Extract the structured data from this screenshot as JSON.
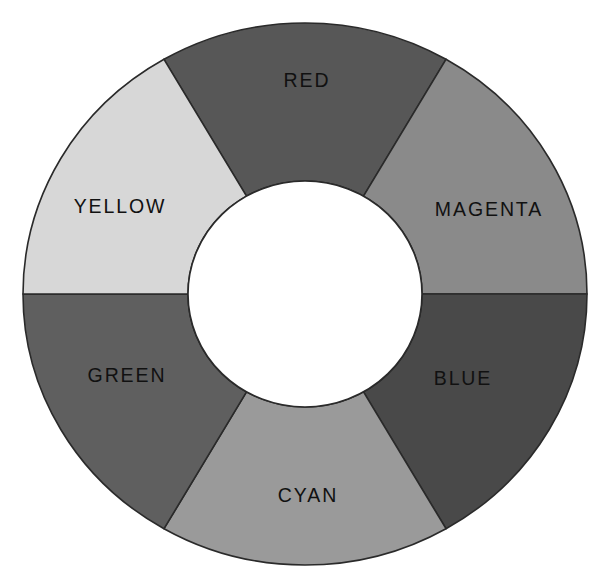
{
  "figure": {
    "name": "color-wheel",
    "background_color": "#ffffff",
    "outline_color": "#2a2a2a",
    "label_color": "#111111",
    "hub_color": "#ffffff",
    "center_x": 305,
    "center_y": 294,
    "outer_radius_x": 282,
    "outer_radius_y": 271,
    "inner_radius_x": 117,
    "inner_radius_y": 113
  },
  "chart_data": {
    "type": "pie",
    "subtype": "donut",
    "grid": false,
    "legend": "none",
    "labels_inside_slices": true,
    "slice_count": 6,
    "slice_angle_degrees": 60,
    "categories": [
      "RED",
      "MAGENTA",
      "BLUE",
      "CYAN",
      "GREEN",
      "YELLOW"
    ],
    "values": [
      60,
      60,
      60,
      60,
      60,
      60
    ],
    "colors": [
      "#575757",
      "#8a8a8a",
      "#494949",
      "#9a9a9a",
      "#5f5f5f",
      "#d7d7d7"
    ],
    "series": [
      {
        "name": "color-wheel-segments",
        "values": [
          60,
          60,
          60,
          60,
          60,
          60
        ]
      }
    ],
    "slices": [
      {
        "label": "RED",
        "color": "#575757",
        "start_angle": -120,
        "end_angle": -60,
        "label_x": 307,
        "label_y": 82,
        "label_anchor": "middle"
      },
      {
        "label": "MAGENTA",
        "color": "#8a8a8a",
        "start_angle": -60,
        "end_angle": 0,
        "label_x": 489,
        "label_y": 211,
        "label_anchor": "middle"
      },
      {
        "label": "BLUE",
        "color": "#494949",
        "start_angle": 0,
        "end_angle": 60,
        "label_x": 463,
        "label_y": 380,
        "label_anchor": "middle"
      },
      {
        "label": "CYAN",
        "color": "#9a9a9a",
        "start_angle": 60,
        "end_angle": 120,
        "label_x": 308,
        "label_y": 497,
        "label_anchor": "middle"
      },
      {
        "label": "GREEN",
        "color": "#5f5f5f",
        "start_angle": 120,
        "end_angle": 180,
        "label_x": 127,
        "label_y": 377,
        "label_anchor": "middle"
      },
      {
        "label": "YELLOW",
        "color": "#d7d7d7",
        "start_angle": 180,
        "end_angle": 240,
        "label_x": 120,
        "label_y": 208,
        "label_anchor": "middle"
      }
    ]
  }
}
